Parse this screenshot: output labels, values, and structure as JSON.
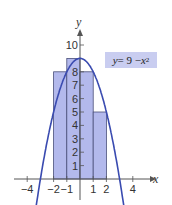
{
  "chart_data": {
    "type": "bar",
    "title": "",
    "xlabel": "x",
    "ylabel": "y",
    "annotation": "y = 9 − x²",
    "function": "y = 9 - x^2",
    "rectangles": [
      {
        "x_from": -2,
        "x_to": -1,
        "height": 8
      },
      {
        "x_from": -1,
        "x_to": 0,
        "height": 9
      },
      {
        "x_from": 0,
        "x_to": 1,
        "height": 8
      },
      {
        "x_from": 1,
        "x_to": 2,
        "height": 5
      }
    ],
    "categories": [
      "[-2,-1]",
      "[-1,0]",
      "[0,1]",
      "[1,2]"
    ],
    "values": [
      8,
      9,
      8,
      5
    ],
    "x_ticks": [
      -4,
      -2,
      -1,
      1,
      2,
      4
    ],
    "x_tick_labels": [
      "−4",
      "−2",
      "−1",
      "1",
      "2",
      "4"
    ],
    "y_ticks": [
      1,
      2,
      3,
      4,
      5,
      6,
      7,
      8,
      10
    ],
    "y_tick_labels": [
      "1",
      "2",
      "3",
      "4",
      "5",
      "6",
      "7",
      "8",
      "10"
    ],
    "xlim": [
      -5,
      5
    ],
    "ylim": [
      -1.5,
      11
    ],
    "grid": false,
    "legend": "none",
    "colors": {
      "rect_fill": "#b3b9ec",
      "rect_stroke": "#4a4f7a",
      "curve": "#3a4bb0",
      "axis": "#555555",
      "label_bg": "#c9cdf0"
    }
  },
  "labels": {
    "x_axis": "x",
    "y_axis": "y",
    "eq_y": "y",
    "eq_mid": " = 9 − ",
    "eq_x": "x",
    "eq_exp": "2"
  }
}
